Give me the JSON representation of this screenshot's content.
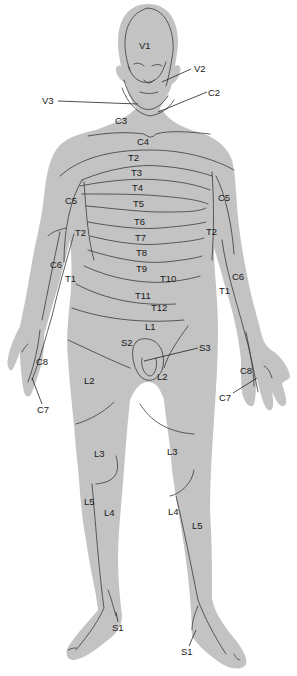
{
  "figure": {
    "type": "dermatome map, anterior view of human body",
    "body_color": "#c3c3c3",
    "line_color": "#3a3a3a",
    "background": "#ffffff"
  },
  "labels": {
    "head": {
      "v1": "V1",
      "v2": "V2",
      "v3": "V3",
      "c2": "C2"
    },
    "neck": {
      "c3": "C3",
      "c4": "C4"
    },
    "trunk": {
      "t2": "T2",
      "t3": "T3",
      "t4": "T4",
      "t5": "T5",
      "t6": "T6",
      "t7": "T7",
      "t8": "T8",
      "t9": "T9",
      "t10": "T10",
      "t11": "T11",
      "t12": "T12",
      "l1": "L1"
    },
    "right_arm": {
      "c5": "C5",
      "t2": "T2",
      "c6": "C6",
      "t1": "T1",
      "c8": "C8",
      "c7": "C7"
    },
    "left_arm": {
      "c5": "C5",
      "t2": "T2",
      "c6": "C6",
      "t1": "T1",
      "c8": "C8",
      "c7": "C7"
    },
    "groin": {
      "s2": "S2",
      "s3": "S3"
    },
    "right_leg": {
      "l2": "L2",
      "l3": "L3",
      "l5": "L5",
      "l4": "L4",
      "s1": "S1"
    },
    "left_leg": {
      "l2": "L2",
      "l3": "L3",
      "l4": "L4",
      "l5": "L5",
      "s1": "S1"
    }
  }
}
